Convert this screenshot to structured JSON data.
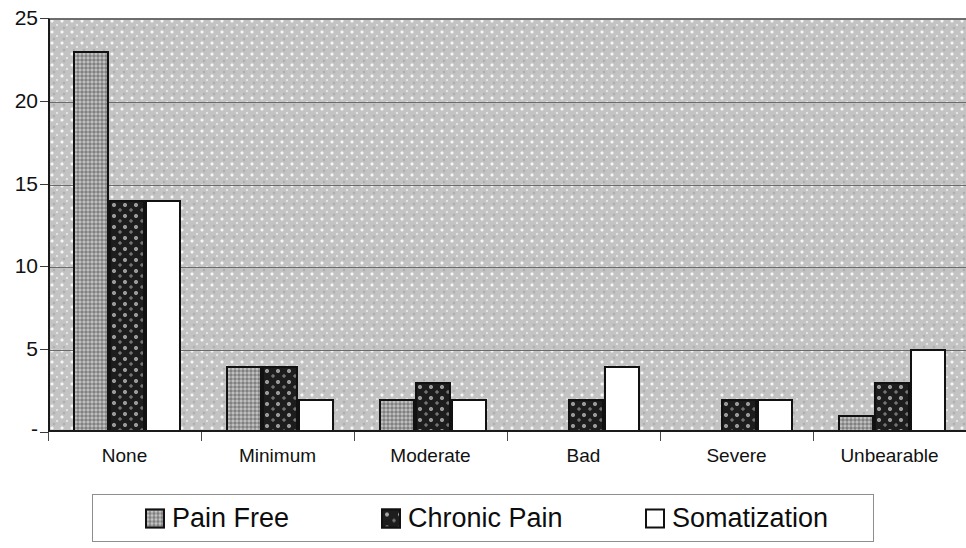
{
  "chart_data": {
    "type": "bar",
    "title": "",
    "subtitle": "",
    "xlabel": "",
    "ylabel": "",
    "categories": [
      "None",
      "Minimum",
      "Moderate",
      "Bad",
      "Severe",
      "Unbearable"
    ],
    "series": [
      {
        "name": "Pain Free",
        "values": [
          23,
          4,
          2,
          0,
          0,
          1
        ],
        "swatch": "gray-textured-square",
        "color": "#9d9d9d"
      },
      {
        "name": "Chronic Pain",
        "values": [
          14,
          4,
          3,
          2,
          2,
          3
        ],
        "swatch": "black-textured-square",
        "color": "#1d1d1d"
      },
      {
        "name": "Somatization",
        "values": [
          14,
          2,
          2,
          4,
          2,
          5
        ],
        "swatch": "white-square",
        "color": "#ffffff"
      }
    ],
    "ylim": [
      0,
      25
    ],
    "ytick_values": [
      0,
      5,
      10,
      15,
      20,
      25
    ],
    "ytick_labels": [
      "-",
      "5",
      "10",
      "15",
      "20",
      "25"
    ],
    "grid": true,
    "grid_axis": "y",
    "legend_position": "bottom",
    "plot_background": "#c3c3c3",
    "bar_border_color": "#111111",
    "gridline_color": "#6b6b6b",
    "axis_color": "#1a1a1a"
  },
  "legend": {
    "items": [
      {
        "label": "Pain Free"
      },
      {
        "label": "Chronic Pain"
      },
      {
        "label": "Somatization"
      }
    ]
  }
}
